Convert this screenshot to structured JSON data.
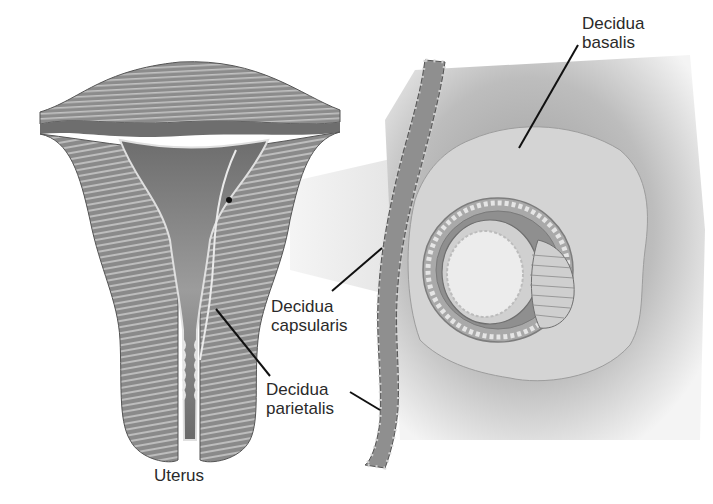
{
  "figure": {
    "left_panel": {
      "caption": "Uterus"
    },
    "labels": {
      "decidua_basalis": {
        "line1": "Decidua",
        "line2": "basalis"
      },
      "decidua_capsularis": {
        "line1": "Decidua",
        "line2": "capsularis"
      },
      "decidua_parietalis": {
        "line1": "Decidua",
        "line2": "parietalis"
      }
    },
    "colors": {
      "background": "#ffffff",
      "muscle": "#8f8f8f",
      "muscle_dark": "#6e6e6e",
      "muscle_stripe": "#c9c9c9",
      "cavity": "#7a7a7a",
      "decidua_light": "#cfcfcf",
      "tissue_shadow": "#b5b5b5",
      "leader_line": "#111111",
      "text": "#2a2a2a"
    }
  }
}
